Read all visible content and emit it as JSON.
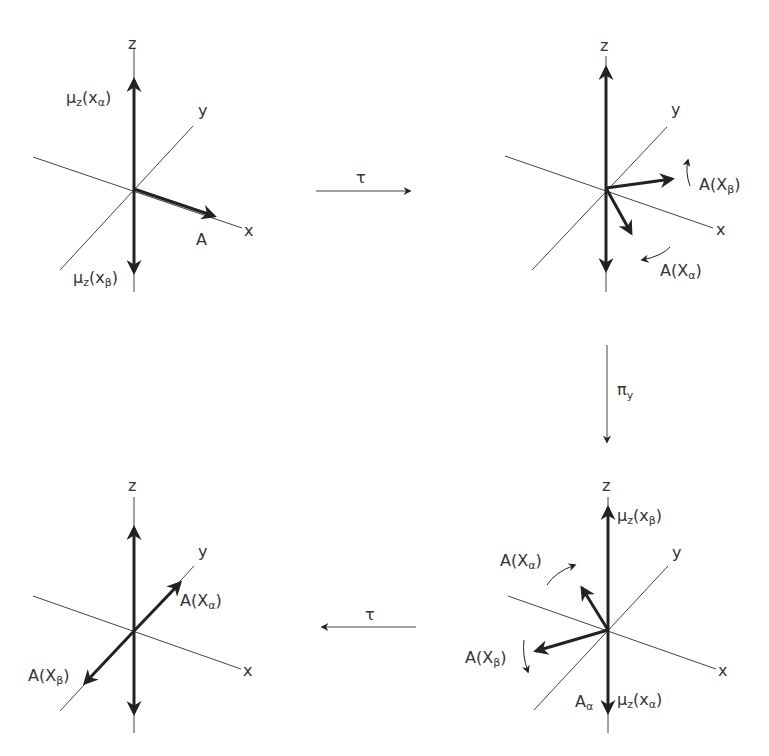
{
  "panels": {
    "top_left": {
      "axes": {
        "z": "z",
        "y": "y",
        "x": "x"
      },
      "vectors": {
        "up": "μ",
        "up_sub": "z",
        "up_arg": "(x",
        "up_arg_sub": "α",
        "down": "μ",
        "down_sub": "z",
        "down_arg": "(x",
        "down_arg_sub": "β",
        "a": "A"
      }
    },
    "top_right": {
      "axes": {
        "z": "z",
        "y": "y",
        "x": "x"
      },
      "labels": {
        "a_beta": "A(X",
        "a_beta_sub": "β",
        "a_alpha": "A(X",
        "a_alpha_sub": "α"
      }
    },
    "bottom_left": {
      "axes": {
        "z": "z",
        "y": "y",
        "x": "x"
      },
      "labels": {
        "a_alpha": "A(X",
        "a_alpha_sub": "α",
        "a_beta": "A(X",
        "a_beta_sub": "β"
      }
    },
    "bottom_right": {
      "axes": {
        "z": "z",
        "y": "y",
        "x": "x"
      },
      "labels": {
        "mu_beta": "μ",
        "mu_beta_sub": "z",
        "mu_beta_arg": "(x",
        "mu_beta_arg_sub": "β",
        "mu_alpha": "μ",
        "mu_alpha_sub": "z",
        "mu_alpha_arg": "(x",
        "mu_alpha_arg_sub": "α",
        "a_alpha": "A(X",
        "a_alpha_sub": "α",
        "a_beta": "A(X",
        "a_beta_sub": "β",
        "a_alpha_bottom": "A",
        "a_alpha_bottom_sub": "α"
      }
    }
  },
  "operations": {
    "tau_top": "τ",
    "pi": "π",
    "pi_sub": "y",
    "tau_bottom": "τ"
  }
}
